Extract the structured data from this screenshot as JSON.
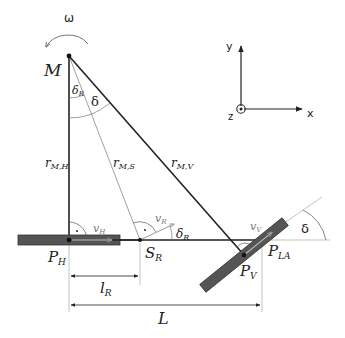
{
  "diagram": {
    "colors": {
      "line": "#222222",
      "thin_line": "#888888",
      "wheel_fill": "#555555",
      "wheel_stroke": "#333333",
      "velocity_arrow": "#bbbbbb",
      "background": "#ffffff"
    },
    "points": {
      "M": {
        "label": "M",
        "x": 69,
        "y": 56
      },
      "P_H": {
        "label": "P",
        "sub": "H",
        "x": 69,
        "y": 240
      },
      "S_R": {
        "label": "S",
        "sub": "R",
        "x": 140,
        "y": 240
      },
      "P_V": {
        "label": "P",
        "sub": "V",
        "x": 244,
        "y": 255
      },
      "P_LA": {
        "label": "P",
        "sub": "LA",
        "x": 262,
        "y": 240
      }
    },
    "radii": {
      "r_MH": {
        "label": "r",
        "sub": "M,H"
      },
      "r_MS": {
        "label": "r",
        "sub": "M,S"
      },
      "r_MV": {
        "label": "r",
        "sub": "M,V"
      }
    },
    "angles": {
      "delta": "δ",
      "delta_R": {
        "label": "δ",
        "sub": "R"
      },
      "omega": "ω"
    },
    "velocities": {
      "v_H": {
        "label": "v",
        "sub": "H"
      },
      "v_R": {
        "label": "v",
        "sub": "R"
      },
      "v_V": {
        "label": "v",
        "sub": "V"
      }
    },
    "dimensions": {
      "l_R": {
        "label": "l",
        "sub": "R"
      },
      "L": {
        "label": "L"
      }
    },
    "axes": {
      "x": "x",
      "y": "y",
      "z": "z"
    }
  }
}
